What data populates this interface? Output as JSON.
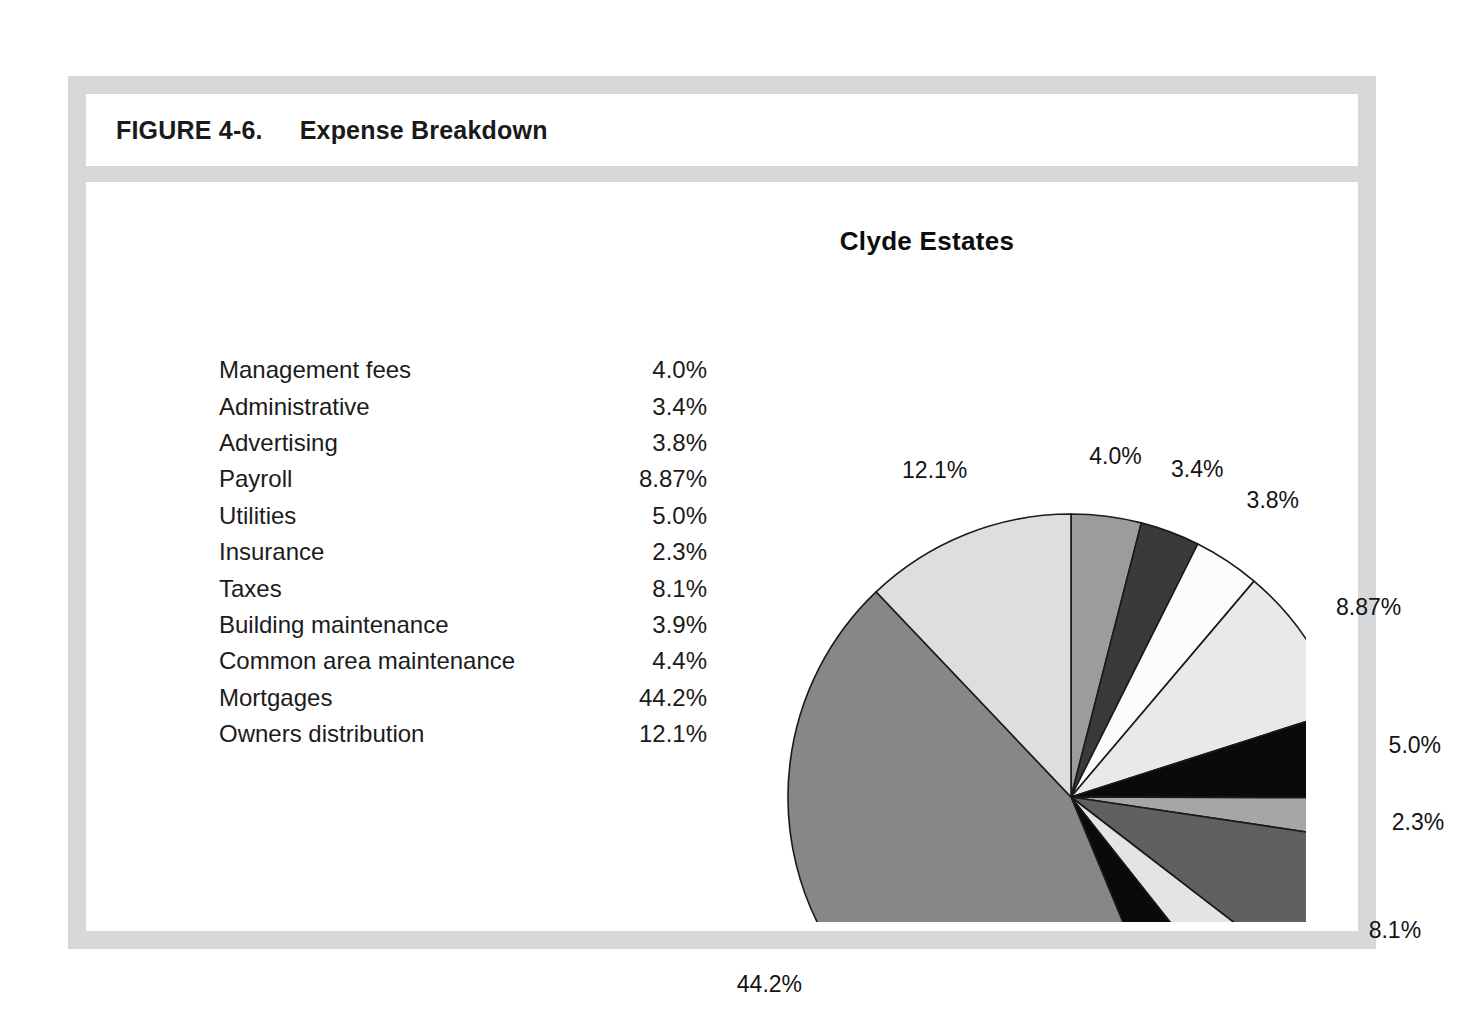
{
  "figure": {
    "number": "FIGURE 4-6.",
    "title": "Expense Breakdown"
  },
  "chart": {
    "title": "Clyde Estates"
  },
  "legend": {
    "rows": [
      {
        "category": "Management fees",
        "value": "4.0%"
      },
      {
        "category": "Administrative",
        "value": "3.4%"
      },
      {
        "category": "Advertising",
        "value": "3.8%"
      },
      {
        "category": "Payroll",
        "value": "8.87%"
      },
      {
        "category": "Utilities",
        "value": "5.0%"
      },
      {
        "category": "Insurance",
        "value": "2.3%"
      },
      {
        "category": "Taxes",
        "value": "8.1%"
      },
      {
        "category": "Building maintenance",
        "value": "3.9%"
      },
      {
        "category": "Common area maintenance",
        "value": "4.4%"
      },
      {
        "category": "Mortgages",
        "value": "44.2%"
      },
      {
        "category": "Owners distribution",
        "value": "12.1%"
      }
    ]
  },
  "chart_data": {
    "type": "pie",
    "title": "Clyde Estates",
    "xlabel": "",
    "ylabel": "",
    "legend_position": "left-table",
    "grid": false,
    "start_angle_deg": 0,
    "direction": "clockwise",
    "categories": [
      "Management fees",
      "Administrative",
      "Advertising",
      "Payroll",
      "Utilities",
      "Insurance",
      "Taxes",
      "Building maintenance",
      "Common area maintenance",
      "Mortgages",
      "Owners distribution"
    ],
    "values": [
      4.0,
      3.4,
      3.8,
      8.87,
      5.0,
      2.3,
      8.1,
      3.9,
      4.4,
      44.2,
      12.1
    ],
    "data_labels": [
      "4.0%",
      "3.4%",
      "3.8%",
      "8.87%",
      "5.0%",
      "2.3%",
      "8.1%",
      "3.9%",
      "4.4%",
      "44.2%",
      "12.1%"
    ],
    "slice_colors": [
      "#9c9c9c",
      "#3a3a3a",
      "#fcfcfc",
      "#e9e9e9",
      "#0a0a0a",
      "#a6a6a6",
      "#606060",
      "#e4e4e4",
      "#0a0a0a",
      "#878787",
      "#dedede"
    ],
    "slice_edge_color": "#1a1a1a",
    "total": 100.07
  },
  "colors": {
    "frame": "#d6d8da",
    "page_background": "#ffffff",
    "text": "#1a1a1a"
  }
}
